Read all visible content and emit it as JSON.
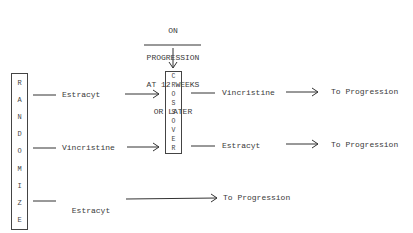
{
  "note": [
    "ON",
    "PROGRESSION",
    "AT 12 WEEKS",
    "OR LATER"
  ],
  "randomize_label": [
    "R",
    "A",
    "N",
    "D",
    "O",
    "M",
    "I",
    "Z",
    "E"
  ],
  "crossover_label": [
    "C",
    "R",
    "O",
    "S",
    "S",
    "O",
    "V",
    "E",
    "R"
  ],
  "arms": [
    {
      "drug": "Estracyt",
      "after_crossover": "Vincristine",
      "endpoint": "To Progression"
    },
    {
      "drug": "Vincristine",
      "after_crossover": "Estracyt",
      "endpoint": "To Progression"
    },
    {
      "drug_lines": [
        "Estracyt",
        "plus",
        "Vincristine"
      ],
      "endpoint": "To Progression"
    }
  ]
}
